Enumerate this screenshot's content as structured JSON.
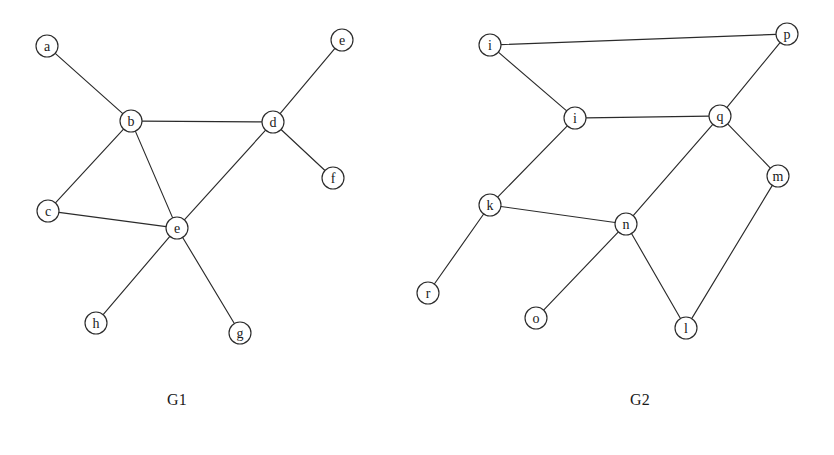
{
  "figure": {
    "background_color": "#ffffff",
    "stroke_color": "#2b2b2b",
    "node_fill": "#ffffff",
    "node_radius": 11
  },
  "graphs": [
    {
      "id": "G1",
      "caption": "G1",
      "caption_x": 177,
      "caption_y": 405,
      "nodes": [
        {
          "id": "a",
          "label": "a",
          "x": 47,
          "y": 46
        },
        {
          "id": "b",
          "label": "b",
          "x": 131,
          "y": 121
        },
        {
          "id": "c",
          "label": "c",
          "x": 48,
          "y": 211
        },
        {
          "id": "d",
          "label": "d",
          "x": 273,
          "y": 122
        },
        {
          "id": "e_top",
          "label": "e",
          "x": 342,
          "y": 40
        },
        {
          "id": "e",
          "label": "e",
          "x": 177,
          "y": 228
        },
        {
          "id": "f",
          "label": "f",
          "x": 333,
          "y": 178
        },
        {
          "id": "g",
          "label": "g",
          "x": 240,
          "y": 333
        },
        {
          "id": "h",
          "label": "h",
          "x": 96,
          "y": 323
        }
      ],
      "edges": [
        {
          "from": "a",
          "to": "b"
        },
        {
          "from": "b",
          "to": "d"
        },
        {
          "from": "b",
          "to": "c"
        },
        {
          "from": "b",
          "to": "e"
        },
        {
          "from": "c",
          "to": "e"
        },
        {
          "from": "d",
          "to": "e_top"
        },
        {
          "from": "d",
          "to": "f"
        },
        {
          "from": "d",
          "to": "e"
        },
        {
          "from": "e",
          "to": "h"
        },
        {
          "from": "e",
          "to": "g"
        }
      ]
    },
    {
      "id": "G2",
      "caption": "G2",
      "caption_x": 640,
      "caption_y": 405,
      "nodes": [
        {
          "id": "i1",
          "label": "i",
          "x": 490,
          "y": 45
        },
        {
          "id": "i2",
          "label": "i",
          "x": 575,
          "y": 118
        },
        {
          "id": "p",
          "label": "p",
          "x": 787,
          "y": 34
        },
        {
          "id": "q",
          "label": "q",
          "x": 720,
          "y": 116
        },
        {
          "id": "m",
          "label": "m",
          "x": 778,
          "y": 176
        },
        {
          "id": "k",
          "label": "k",
          "x": 490,
          "y": 205
        },
        {
          "id": "n",
          "label": "n",
          "x": 626,
          "y": 224
        },
        {
          "id": "r",
          "label": "r",
          "x": 428,
          "y": 293
        },
        {
          "id": "o",
          "label": "o",
          "x": 536,
          "y": 318
        },
        {
          "id": "l",
          "label": "l",
          "x": 686,
          "y": 328
        }
      ],
      "edges": [
        {
          "from": "i1",
          "to": "p"
        },
        {
          "from": "i1",
          "to": "i2"
        },
        {
          "from": "i2",
          "to": "q"
        },
        {
          "from": "i2",
          "to": "k"
        },
        {
          "from": "p",
          "to": "q"
        },
        {
          "from": "q",
          "to": "m"
        },
        {
          "from": "q",
          "to": "n"
        },
        {
          "from": "k",
          "to": "n"
        },
        {
          "from": "k",
          "to": "r"
        },
        {
          "from": "n",
          "to": "o"
        },
        {
          "from": "n",
          "to": "l"
        },
        {
          "from": "m",
          "to": "l"
        }
      ]
    }
  ]
}
